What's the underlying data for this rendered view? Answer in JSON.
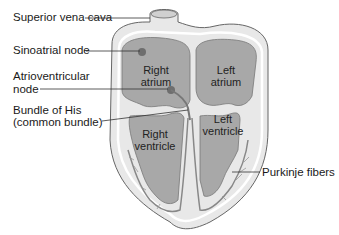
{
  "diagram": {
    "labels": {
      "superior_vena_cava": "Superior vena cava",
      "sinoatrial_node": "Sinoatrial node",
      "atrioventricular_node_line1": "Atrioventricular",
      "atrioventricular_node_line2": "node",
      "bundle_of_his_line1": "Bundle of His",
      "bundle_of_his_line2": "(common bundle)",
      "purkinje_fibers": "Purkinje fibers"
    },
    "chambers": {
      "right_atrium_line1": "Right",
      "right_atrium_line2": "atrium",
      "left_atrium_line1": "Left",
      "left_atrium_line2": "atrium",
      "right_ventricle_line1": "Right",
      "right_ventricle_line2": "ventricle",
      "left_ventricle_line1": "Left",
      "left_ventricle_line2": "ventricle"
    },
    "colors": {
      "wall": "#e6e6e6",
      "chamber": "#a9a9a9",
      "outline": "#555555",
      "node": "#6e6e6e",
      "leader": "#333333"
    }
  }
}
